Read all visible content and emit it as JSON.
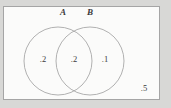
{
  "figure": {
    "type": "venn-diagram",
    "background_color": "#d8d8d6",
    "canvas_color": "#fbfbfa",
    "stroke_color": "#a5a5a5",
    "text_color": "#3a3a3a"
  },
  "universe": {
    "name": "sample-space-rectangle",
    "x": 3,
    "y": 6,
    "width": 157,
    "height": 94
  },
  "sets": [
    {
      "id": "A",
      "label": "A",
      "label_x": 63,
      "label_y": 15,
      "cx": 58,
      "cy": 61,
      "r": 34
    },
    {
      "id": "B",
      "label": "B",
      "label_x": 90,
      "label_y": 15,
      "cx": 90,
      "cy": 61,
      "r": 34
    }
  ],
  "regions": [
    {
      "id": "a-only",
      "label": ".2",
      "value": 0.2,
      "x": 43,
      "y": 62
    },
    {
      "id": "a-and-b",
      "label": ".2",
      "value": 0.2,
      "x": 74,
      "y": 62
    },
    {
      "id": "b-only",
      "label": ".1",
      "value": 0.1,
      "x": 105,
      "y": 62
    },
    {
      "id": "outside",
      "label": ".5",
      "value": 0.5,
      "x": 144,
      "y": 91
    }
  ],
  "chart_data": {
    "type": "venn",
    "title": "",
    "sets": [
      "A",
      "B"
    ],
    "categories": [
      "A only",
      "A and B",
      "B only",
      "Neither A nor B"
    ],
    "values": [
      0.2,
      0.2,
      0.1,
      0.5
    ],
    "labels": [
      ".2",
      ".2",
      ".1",
      ".5"
    ],
    "total": 1.0
  }
}
